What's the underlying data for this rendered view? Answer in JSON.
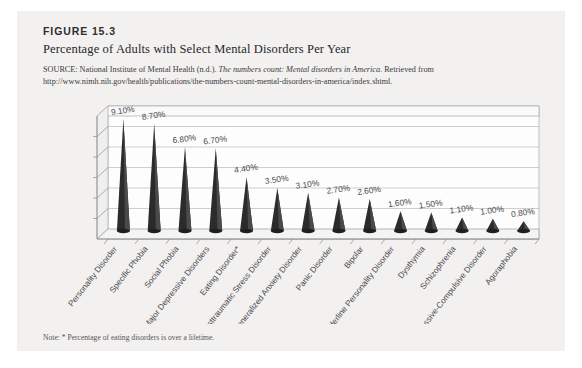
{
  "figure": {
    "number": "FIGURE 15.3",
    "title": "Percentage of Adults with Select Mental Disorders Per Year",
    "source_prefix": "SOURCE: National Institute of Mental Health (n.d.). ",
    "source_italic": "The numbers count: Mental disorders in America",
    "source_suffix": ". Retrieved from http://www.nimh.nih.gov/health/publications/the-numbers-count-mental-disorders-in-america/index.shtml.",
    "note": "Note: * Percentage of eating disorders is over a lifetime."
  },
  "chart_data": {
    "type": "bar",
    "title": "Percentage of Adults with Select Mental Disorders Per Year",
    "xlabel": "",
    "ylabel": "",
    "ylim": [
      0,
      10
    ],
    "grid": true,
    "legend": "none",
    "categories": [
      "Personality Disorder",
      "Specific Phobia",
      "Social Phobia",
      "Major Depressive Disorders",
      "Eating Disorder*",
      "Posttraumatic Stress Disorder",
      "Generalized Anxiety Disorder",
      "Panic Disorder",
      "Bipolar",
      "Borderline Personality Disorder",
      "Dysthymia",
      "Schizophrenia",
      "Obsessive-Compulsive Disorder",
      "Agoraphobia"
    ],
    "values": [
      9.1,
      8.7,
      6.8,
      6.7,
      4.4,
      3.5,
      3.1,
      2.7,
      2.6,
      1.6,
      1.5,
      1.1,
      1.0,
      0.8
    ],
    "value_labels": [
      "9.10%",
      "8.70%",
      "6.80%",
      "6.70%",
      "4.40%",
      "3.50%",
      "3.10%",
      "2.70%",
      "2.60%",
      "1.60%",
      "1.50%",
      "1.10%",
      "1.00%",
      "0.80%"
    ],
    "gridline_count": 5,
    "bar_color": "#2b2b2b",
    "plot_background": "#fdfdfd"
  }
}
